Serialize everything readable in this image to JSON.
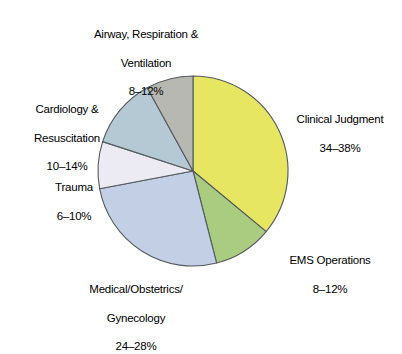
{
  "chart_data": {
    "type": "pie",
    "title": "",
    "subtitle": "",
    "xlabel": "",
    "ylabel": "",
    "legend_position": "none",
    "grid": false,
    "label_format": "range_percent",
    "start_angle_deg": 0,
    "direction": "clockwise",
    "categories": [
      "Clinical Judgment",
      "EMS Operations",
      "Medical/Obstetrics/\nGynecology",
      "Trauma",
      "Cardiology &\nResuscitation",
      "Airway, Respiration &\nVentilation"
    ],
    "values": [
      36,
      10,
      26,
      8,
      12,
      10
    ],
    "value_labels": [
      "34–38%",
      "8–12%",
      "24–28%",
      "6–10%",
      "10–14%",
      "8–12%"
    ],
    "value_ranges": [
      {
        "min": 34,
        "max": 38
      },
      {
        "min": 8,
        "max": 12
      },
      {
        "min": 24,
        "max": 28
      },
      {
        "min": 6,
        "max": 10
      },
      {
        "min": 10,
        "max": 14
      },
      {
        "min": 8,
        "max": 12
      }
    ],
    "colors": [
      "#E6E662",
      "#AACC80",
      "#C3CFE4",
      "#ECEAF2",
      "#B4C9D4",
      "#B8B8B3"
    ],
    "slice_outline_color": "#555A5E",
    "slices": [
      {
        "name": "Clinical Judgment",
        "value_label": "34–38%",
        "value": 36,
        "color": "#E6E662",
        "start_deg": 0,
        "end_deg": 129.6
      },
      {
        "name": "EMS Operations",
        "value_label": "8–12%",
        "value": 10,
        "color": "#AACC80",
        "start_deg": 129.6,
        "end_deg": 165.6
      },
      {
        "name": "Medical/Obstetrics/Gynecology",
        "value_label": "24–28%",
        "value": 26,
        "color": "#C3CFE4",
        "start_deg": 165.6,
        "end_deg": 259.2
      },
      {
        "name": "Trauma",
        "value_label": "6–10%",
        "value": 8,
        "color": "#ECEAF2",
        "start_deg": 259.2,
        "end_deg": 288.0
      },
      {
        "name": "Cardiology & Resuscitation",
        "value_label": "10–14%",
        "value": 12,
        "color": "#B4C9D4",
        "start_deg": 288.0,
        "end_deg": 331.2
      },
      {
        "name": "Airway, Respiration & Ventilation",
        "value_label": "8–12%",
        "value": 10,
        "color": "#B8B8B3",
        "start_deg": 331.2,
        "end_deg": 360.0
      }
    ]
  },
  "labels": {
    "airway": {
      "line1": "Airway, Respiration &",
      "line2": "Ventilation",
      "value": "8–12%"
    },
    "cardiology": {
      "line1": "Cardiology &",
      "line2": "Resuscitation",
      "value": "10–14%"
    },
    "trauma": {
      "line1": "Trauma",
      "line2": "",
      "value": "6–10%"
    },
    "medical": {
      "line1": "Medical/Obstetrics/",
      "line2": "Gynecology",
      "value": "24–28%"
    },
    "clinical": {
      "line1": "Clinical Judgment",
      "line2": "",
      "value": "34–38%"
    },
    "ems": {
      "line1": "EMS Operations",
      "line2": "",
      "value": "8–12%"
    }
  }
}
